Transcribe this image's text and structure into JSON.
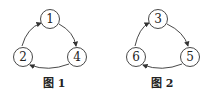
{
  "figures": [
    {
      "caption": "图 1",
      "nodes": [
        {
          "label": "1",
          "cx": 50,
          "cy": 19
        },
        {
          "label": "4",
          "cx": 77,
          "cy": 57
        },
        {
          "label": "2",
          "cx": 23,
          "cy": 57
        }
      ],
      "edges": [
        [
          "1",
          "4"
        ],
        [
          "4",
          "2"
        ],
        [
          "2",
          "1"
        ]
      ]
    },
    {
      "caption": "图 2",
      "nodes": [
        {
          "label": "3",
          "cx": 158,
          "cy": 19
        },
        {
          "label": "5",
          "cx": 190,
          "cy": 57
        },
        {
          "label": "6",
          "cx": 136,
          "cy": 57
        }
      ],
      "edges": [
        [
          "3",
          "5"
        ],
        [
          "5",
          "6"
        ],
        [
          "6",
          "3"
        ]
      ]
    }
  ],
  "colors": {
    "stroke": "#333333",
    "background": "#ffffff"
  }
}
